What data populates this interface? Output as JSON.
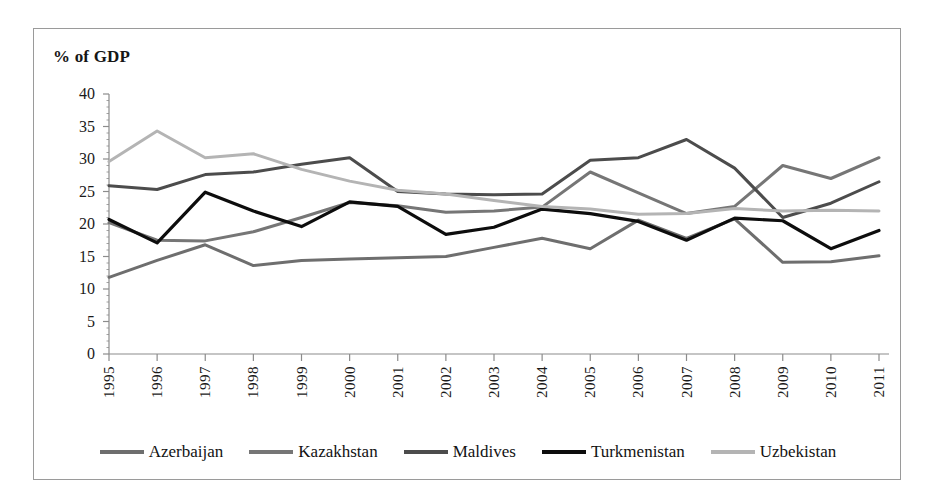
{
  "chart_data": {
    "type": "line",
    "title": "",
    "axis_note": "% of GDP",
    "xlabel": "",
    "ylabel": "% of GDP",
    "ylim": [
      0,
      40
    ],
    "yticks": [
      0,
      5,
      10,
      15,
      20,
      25,
      30,
      35,
      40
    ],
    "grid": false,
    "legend_position": "bottom",
    "categories": [
      "1995",
      "1996",
      "1997",
      "1998",
      "1999",
      "2000",
      "2001",
      "2002",
      "2003",
      "2004",
      "2005",
      "2006",
      "2007",
      "2008",
      "2009",
      "2010",
      "2011"
    ],
    "series": [
      {
        "name": "Azerbaijan",
        "color": "#6e6e6e",
        "values": [
          11.8,
          14.4,
          16.8,
          13.6,
          14.4,
          14.6,
          14.8,
          15.0,
          16.4,
          17.8,
          16.2,
          20.6,
          17.8,
          20.8,
          14.1,
          14.2,
          15.1
        ]
      },
      {
        "name": "Kazakhstan",
        "color": "#767676",
        "values": [
          20.2,
          17.5,
          17.4,
          18.8,
          21.0,
          23.3,
          22.8,
          21.8,
          22.0,
          22.6,
          28.0,
          24.8,
          21.6,
          22.7,
          29.0,
          27.0,
          30.2
        ]
      },
      {
        "name": "Maldives",
        "color": "#4c4c4c",
        "values": [
          25.9,
          25.3,
          27.6,
          28.0,
          29.2,
          30.2,
          25.0,
          24.6,
          24.5,
          24.6,
          29.8,
          30.2,
          33.0,
          28.6,
          21.0,
          23.2,
          26.5
        ]
      },
      {
        "name": "Turkmenistan",
        "color": "#0d0d0d",
        "values": [
          20.7,
          17.1,
          24.9,
          22.0,
          19.6,
          23.4,
          22.7,
          18.4,
          19.5,
          22.3,
          21.6,
          20.4,
          17.5,
          20.9,
          20.5,
          16.2,
          19.0
        ]
      },
      {
        "name": "Uzbekistan",
        "color": "#b4b4b4",
        "values": [
          29.6,
          34.3,
          30.2,
          30.8,
          28.4,
          26.6,
          25.2,
          24.6,
          23.6,
          22.7,
          22.3,
          21.5,
          21.6,
          22.4,
          22.0,
          22.1,
          22.0
        ]
      }
    ]
  },
  "legend": {
    "items": [
      {
        "label": "Azerbaijan",
        "color": "#6e6e6e"
      },
      {
        "label": "Kazakhstan",
        "color": "#767676"
      },
      {
        "label": "Maldives",
        "color": "#4c4c4c"
      },
      {
        "label": "Turkmenistan",
        "color": "#0d0d0d"
      },
      {
        "label": "Uzbekistan",
        "color": "#b4b4b4"
      }
    ]
  },
  "axes": {
    "y_title": "% of GDP",
    "axis_color": "#8c8c8c"
  }
}
